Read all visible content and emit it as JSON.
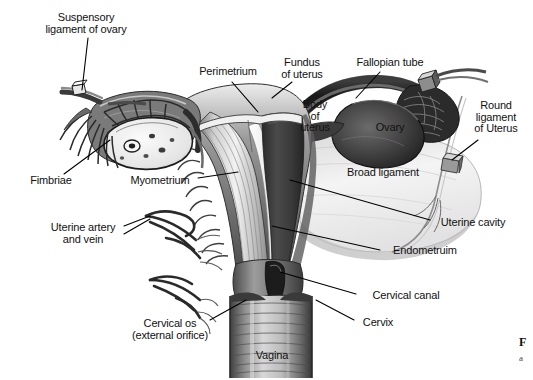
{
  "figure": {
    "style": "grayscale engraving illustration",
    "width": 533,
    "height": 380,
    "background_color": "#ffffff",
    "label_color": "#111111",
    "leader_line_color": "#000000"
  },
  "labels": [
    {
      "id": "suspensory-ligament-of-ovary",
      "text": "Suspensory\nligament of ovary",
      "x": 86,
      "y": 14,
      "align": "center"
    },
    {
      "id": "perimetrium",
      "text": "Perimetrium",
      "x": 228,
      "y": 71,
      "align": "center"
    },
    {
      "id": "fundus-of-uterus",
      "text": "Fundus\nof uterus",
      "x": 302,
      "y": 62,
      "align": "center"
    },
    {
      "id": "fallopian-tube",
      "text": "Fallopian tube",
      "x": 390,
      "y": 62,
      "align": "center"
    },
    {
      "id": "body-of-uterus",
      "text": "Body\nof\nuterus",
      "x": 315,
      "y": 110,
      "align": "center"
    },
    {
      "id": "ovary",
      "text": "Ovary",
      "x": 390,
      "y": 128,
      "align": "center"
    },
    {
      "id": "round-ligament-of-uterus",
      "text": "Round\nligament\nof Uterus",
      "x": 495,
      "y": 110,
      "align": "center"
    },
    {
      "id": "fimbriae",
      "text": "Fimbriae",
      "x": 50,
      "y": 180,
      "align": "center"
    },
    {
      "id": "myometrium",
      "text": "Myometrium",
      "x": 160,
      "y": 180,
      "align": "center"
    },
    {
      "id": "broad-ligament",
      "text": "Broad ligament",
      "x": 383,
      "y": 172,
      "align": "center"
    },
    {
      "id": "uterine-artery-and-vein",
      "text": "Uterine artery\nand vein",
      "x": 83,
      "y": 227,
      "align": "center"
    },
    {
      "id": "uterine-cavity",
      "text": "Uterine cavity",
      "x": 472,
      "y": 223,
      "align": "center"
    },
    {
      "id": "endometruim",
      "text": "Endometruim",
      "x": 424,
      "y": 250,
      "align": "center"
    },
    {
      "id": "cervical-canal",
      "text": "Cervical canal",
      "x": 406,
      "y": 296,
      "align": "center"
    },
    {
      "id": "cervix",
      "text": "Cervix",
      "x": 378,
      "y": 323,
      "align": "center"
    },
    {
      "id": "cervical-os",
      "text": "Cervical os\n(external orifice)",
      "x": 170,
      "y": 324,
      "align": "center"
    },
    {
      "id": "vagina",
      "text": "Vagina",
      "x": 272,
      "y": 355,
      "align": "center"
    }
  ],
  "caption_fragment": {
    "line1": "F",
    "line2": "a"
  }
}
